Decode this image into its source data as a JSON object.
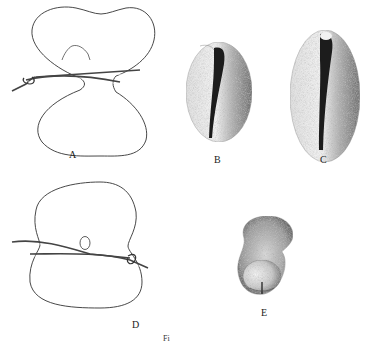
{
  "figure": {
    "panels": [
      {
        "id": "A",
        "label": "A",
        "description": "constricted egg with ligature, upper half with dorsal lip arc"
      },
      {
        "id": "B",
        "label": "B",
        "description": "shaded embryo, dorsal view with dark neural groove"
      },
      {
        "id": "C",
        "label": "C",
        "description": "larger shaded embryo, dorsal view with dark neural groove"
      },
      {
        "id": "D",
        "label": "D",
        "description": "constricted egg with ligature and small oval blastopore"
      },
      {
        "id": "E",
        "label": "E",
        "description": "shaded curled embryo"
      }
    ],
    "caption_partial": "Fi"
  },
  "colors": {
    "ink": "#333333",
    "background": "#ffffff"
  }
}
